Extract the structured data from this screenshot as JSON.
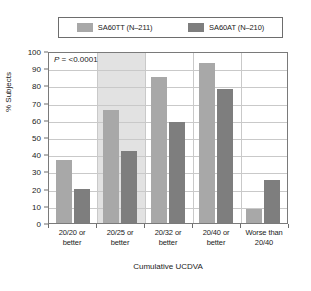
{
  "chart_data": {
    "type": "bar",
    "title": "",
    "xlabel": "Cumulative UCDVA",
    "ylabel": "% Subjects",
    "ylim": [
      0,
      100
    ],
    "ytick_step": 10,
    "yticks": [
      "100",
      "90",
      "80",
      "70",
      "60",
      "50",
      "40",
      "30",
      "20",
      "10",
      "0"
    ],
    "grid": true,
    "legend_position": "top",
    "categories": [
      "20/20 or better",
      "20/25 or better",
      "20/32 or better",
      "20/40 or better",
      "Worse than 20/40"
    ],
    "category_lines": [
      [
        "20/20 or",
        "better"
      ],
      [
        "20/25 or",
        "better"
      ],
      [
        "20/32 or",
        "better"
      ],
      [
        "20/40 or",
        "better"
      ],
      [
        "Worse than",
        "20/40"
      ]
    ],
    "series": [
      {
        "name": "SA60TT (N–211)",
        "color": "#a8a8a8",
        "values": [
          36.5,
          65.5,
          85,
          93,
          8
        ]
      },
      {
        "name": "SA60AT (N–210)",
        "color": "#7e7e7e",
        "values": [
          20,
          42,
          59,
          78,
          25
        ]
      }
    ],
    "annotations": [
      {
        "text_italic": "P",
        "text_rest": " = <0.0001",
        "full_text": "P = <0.0001"
      }
    ],
    "highlight_band": {
      "category_index": 1,
      "color": "#e2e2e2"
    }
  },
  "legend": {
    "entries": [
      {
        "label": "SA60TT (N–211)",
        "color": "#a8a8a8"
      },
      {
        "label": "SA60AT (N–210)",
        "color": "#7e7e7e"
      }
    ]
  },
  "colors": {
    "series_light": "#a8a8a8",
    "series_dark": "#7e7e7e",
    "band": "#e2e2e2",
    "grid": "#c9c9c9",
    "frame": "#7a7a7a",
    "text": "#1a1a1a",
    "background": "#ffffff"
  }
}
